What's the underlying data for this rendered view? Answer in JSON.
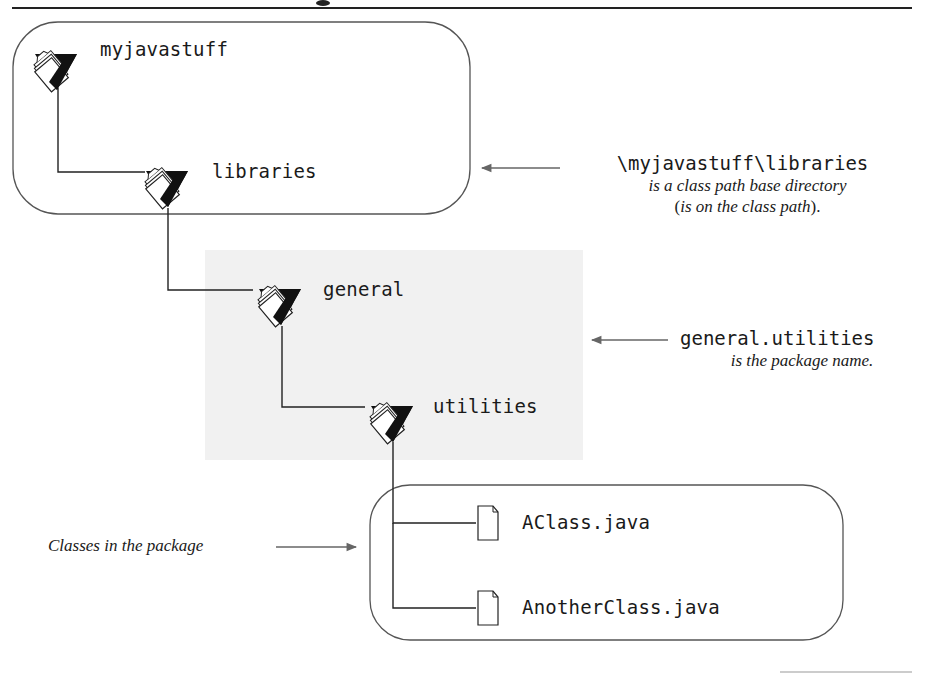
{
  "diagram": {
    "title_partial": "g",
    "colors": {
      "line": "#1a1a1a",
      "box_stroke": "#555555",
      "shaded_region": "#f2f2f2",
      "arrow": "#666666",
      "text": "#1a1a1a"
    },
    "nodes": [
      {
        "id": "myjavastuff",
        "label": "myjavastuff",
        "type": "folder-icon"
      },
      {
        "id": "libraries",
        "label": "libraries",
        "type": "folder-icon"
      },
      {
        "id": "general",
        "label": "general",
        "type": "folder-icon"
      },
      {
        "id": "utilities",
        "label": "utilities",
        "type": "folder-icon"
      },
      {
        "id": "aclass",
        "label": "AClass.java",
        "type": "file-icon"
      },
      {
        "id": "anotherclass",
        "label": "AnotherClass.java",
        "type": "file-icon"
      }
    ],
    "edges": [
      {
        "from": "myjavastuff",
        "to": "libraries"
      },
      {
        "from": "libraries",
        "to": "general"
      },
      {
        "from": "general",
        "to": "utilities"
      },
      {
        "from": "utilities",
        "to": "aclass"
      },
      {
        "from": "utilities",
        "to": "anotherclass"
      }
    ],
    "annotations": {
      "classpath": {
        "code": "\\myjavastuff\\libraries",
        "line1": "is a class path base directory",
        "line2_open": "(",
        "line2_italic": "is on the class path",
        "line2_close": ")."
      },
      "package": {
        "code": "general.utilities",
        "line1": "is the package name."
      },
      "classes": {
        "text": "Classes in the package"
      }
    }
  }
}
